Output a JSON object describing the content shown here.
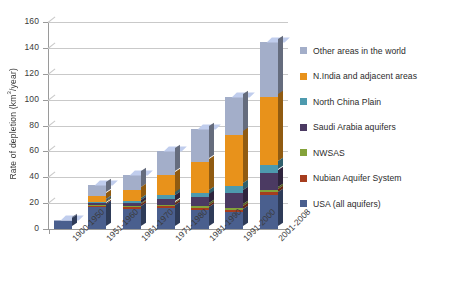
{
  "chart_data": {
    "type": "bar",
    "stacked": true,
    "title": "",
    "subtitle": "",
    "xlabel": "",
    "ylabel": "Rate of depletion (km3/year)",
    "ylabel_parts": {
      "pre": "Rate of depletion (km",
      "sup": "3",
      "post": "/year)"
    },
    "ylim": [
      0,
      160
    ],
    "ytick_step": 20,
    "yticks": [
      0,
      20,
      40,
      60,
      80,
      100,
      120,
      140,
      160
    ],
    "grid": true,
    "grid_axis": "y",
    "legend_position": "right",
    "categories": [
      "1900-1950",
      "1951-1960",
      "1961-1970",
      "1971-1980",
      "1981-1990",
      "1991-2000",
      "2001-2008"
    ],
    "series": [
      {
        "name": "USA (all aquifers)",
        "color": "#4a5f8e",
        "values": [
          6.0,
          17.0,
          15.5,
          16.0,
          14.5,
          13.0,
          26.0
        ]
      },
      {
        "name": "Nubian Aquifer System",
        "color": "#a63d1e",
        "values": [
          0.0,
          0.8,
          1.2,
          1.5,
          1.8,
          2.0,
          2.5
        ]
      },
      {
        "name": "NWSAS",
        "color": "#84a23a",
        "values": [
          0.0,
          0.5,
          0.8,
          1.0,
          1.2,
          1.5,
          1.8
        ]
      },
      {
        "name": "Saudi Arabia aquifers",
        "color": "#4b3a62",
        "values": [
          0.0,
          1.0,
          2.5,
          5.0,
          7.0,
          11.0,
          13.0
        ]
      },
      {
        "name": "North China Plain",
        "color": "#4d9aae",
        "values": [
          0.0,
          0.7,
          1.5,
          2.5,
          3.5,
          5.5,
          6.5
        ]
      },
      {
        "name": "N.India and adjacent areas",
        "color": "#e8921b",
        "values": [
          0.0,
          5.0,
          8.5,
          16.0,
          24.0,
          40.0,
          52.0
        ]
      },
      {
        "name": "Other areas in the world",
        "color": "#a3aec9",
        "values": [
          1.0,
          8.0,
          12.0,
          18.0,
          25.0,
          29.0,
          43.0
        ]
      }
    ],
    "totals": [
      7.0,
      33.0,
      42.0,
      60.0,
      77.0,
      102.0,
      145.0
    ]
  }
}
